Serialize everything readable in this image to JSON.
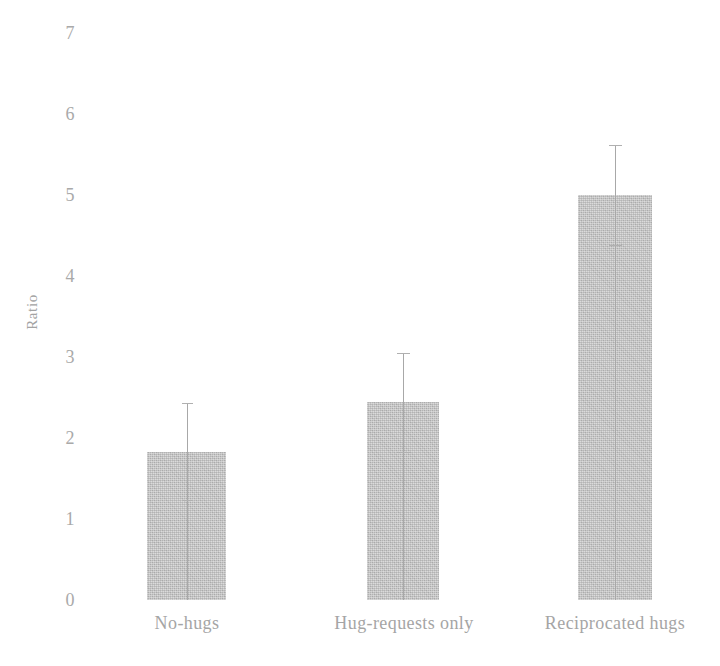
{
  "chart_data": {
    "type": "bar",
    "title": "",
    "subtitle": "",
    "xlabel": "",
    "ylabel": "Ratio",
    "categories": [
      "No-hugs",
      "Hug-requests only",
      "Reciprocated hugs"
    ],
    "values": [
      1.83,
      2.44,
      5.0
    ],
    "errors": [
      0.6,
      0.61,
      0.62
    ],
    "error_type": "symmetric",
    "ylim": [
      0,
      7
    ],
    "ytick_labels": [
      "0",
      "1",
      "2",
      "3",
      "4",
      "5",
      "6",
      "7"
    ],
    "ytick_values": [
      0,
      1,
      2,
      3,
      4,
      5,
      6,
      7
    ],
    "grid": false,
    "legend": false,
    "legend_position": "none",
    "series": [
      {
        "name": "Ratio",
        "values": [
          1.83,
          2.44,
          5.0
        ],
        "errors": [
          0.6,
          0.61,
          0.62
        ]
      }
    ],
    "annotations": [],
    "colors": {
      "bar_fill": "#c2c2c2",
      "error_bar": "#a8a8a8",
      "tick_text": "#a9a9a9",
      "axis_title": "#a3a3a3",
      "background": "#ffffff"
    }
  }
}
